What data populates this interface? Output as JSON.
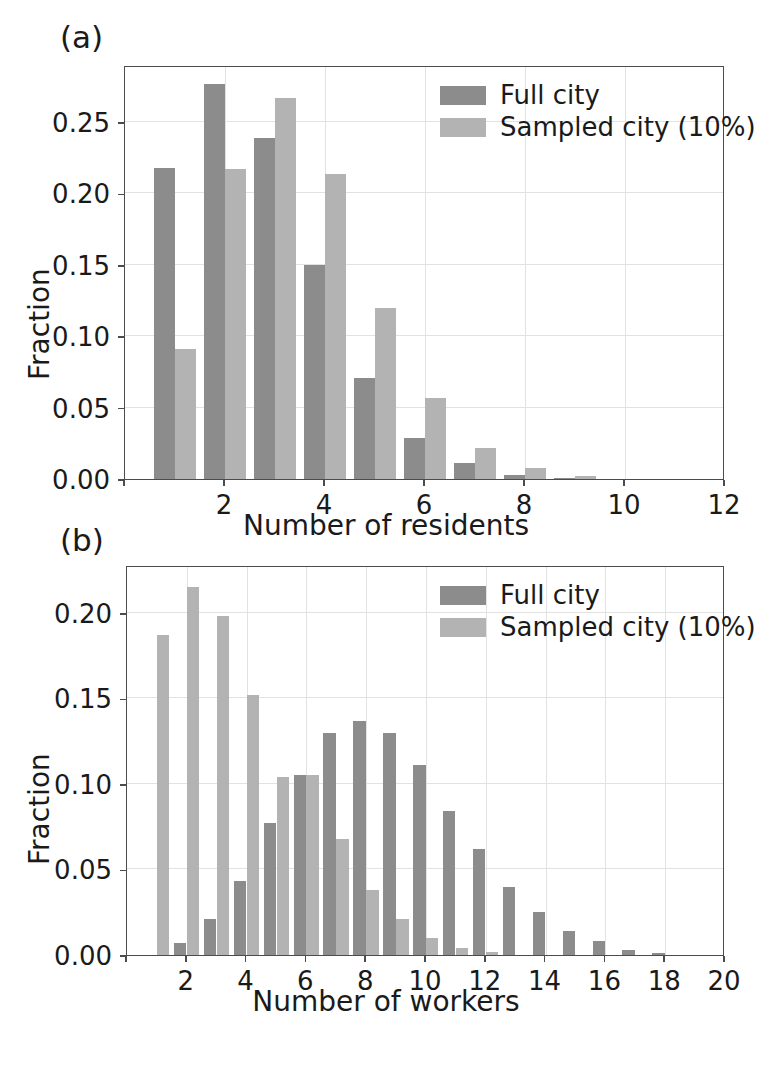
{
  "figure": {
    "width": 772,
    "height": 1073,
    "background": "#ffffff",
    "colors": {
      "full_city": "#8c8c8c",
      "sampled_city": "#b3b3b3",
      "axis": "#4c4c4c",
      "grid": "#e2e2e2",
      "text": "#1a1a1a"
    }
  },
  "panels": [
    {
      "tag": "(a)",
      "legend": {
        "position": "upper right",
        "entries": [
          {
            "label": "Full city",
            "color": "#8c8c8c"
          },
          {
            "label": "Sampled city (10%)",
            "color": "#b3b3b3"
          }
        ]
      },
      "chart_data": {
        "type": "bar",
        "title": "(a)",
        "xlabel": "Number of residents",
        "ylabel": "Fraction",
        "xlim": [
          0,
          12
        ],
        "ylim": [
          0.0,
          0.29
        ],
        "xticks": [
          0,
          2,
          4,
          6,
          8,
          10,
          12
        ],
        "xticklabels": [
          "",
          "2",
          "4",
          "6",
          "8",
          "10",
          "12"
        ],
        "yticks": [
          0.0,
          0.05,
          0.1,
          0.15,
          0.2,
          0.25
        ],
        "yticklabels": [
          "0.00",
          "0.05",
          "0.10",
          "0.15",
          "0.20",
          "0.25"
        ],
        "grid": true,
        "categories": [
          1,
          2,
          3,
          4,
          5,
          6,
          7,
          8,
          9
        ],
        "series": [
          {
            "name": "Full city",
            "color": "#8c8c8c",
            "values": [
              0.218,
              0.277,
              0.239,
              0.15,
              0.071,
              0.029,
              0.011,
              0.003,
              0.001
            ]
          },
          {
            "name": "Sampled city (10%)",
            "color": "#b3b3b3",
            "values": [
              0.091,
              0.217,
              0.267,
              0.214,
              0.12,
              0.057,
              0.022,
              0.008,
              0.002
            ]
          }
        ]
      }
    },
    {
      "tag": "(b)",
      "legend": {
        "position": "upper right",
        "entries": [
          {
            "label": "Full city",
            "color": "#8c8c8c"
          },
          {
            "label": "Sampled city (10%)",
            "color": "#b3b3b3"
          }
        ]
      },
      "chart_data": {
        "type": "bar",
        "title": "(b)",
        "xlabel": "Number of workers",
        "ylabel": "Fraction",
        "xlim": [
          0,
          20
        ],
        "ylim": [
          0.0,
          0.228
        ],
        "xticks": [
          0,
          2,
          4,
          6,
          8,
          10,
          12,
          14,
          16,
          18,
          20
        ],
        "xticklabels": [
          "",
          "2",
          "4",
          "6",
          "8",
          "10",
          "12",
          "14",
          "16",
          "18",
          "20"
        ],
        "yticks": [
          0.0,
          0.05,
          0.1,
          0.15,
          0.2
        ],
        "yticklabels": [
          "0.00",
          "0.05",
          "0.10",
          "0.15",
          "0.20"
        ],
        "grid": true,
        "categories": [
          0,
          1,
          2,
          3,
          4,
          5,
          6,
          7,
          8,
          9,
          10,
          11,
          12,
          13,
          14,
          15,
          16,
          17,
          18
        ],
        "series": [
          {
            "name": "Full city",
            "color": "#8c8c8c",
            "values": [
              0.001,
              0.0,
              0.007,
              0.021,
              0.043,
              0.077,
              0.105,
              0.13,
              0.137,
              0.13,
              0.111,
              0.084,
              0.062,
              0.04,
              0.025,
              0.014,
              0.008,
              0.003,
              0.001
            ]
          },
          {
            "name": "Sampled city (10%)",
            "color": "#b3b3b3",
            "values": [
              0.0,
              0.187,
              0.215,
              0.198,
              0.152,
              0.104,
              0.105,
              0.068,
              0.038,
              0.021,
              0.01,
              0.004,
              0.002,
              0.0,
              0.0,
              0.0,
              0.0,
              0.0,
              0.0
            ]
          }
        ]
      }
    }
  ]
}
